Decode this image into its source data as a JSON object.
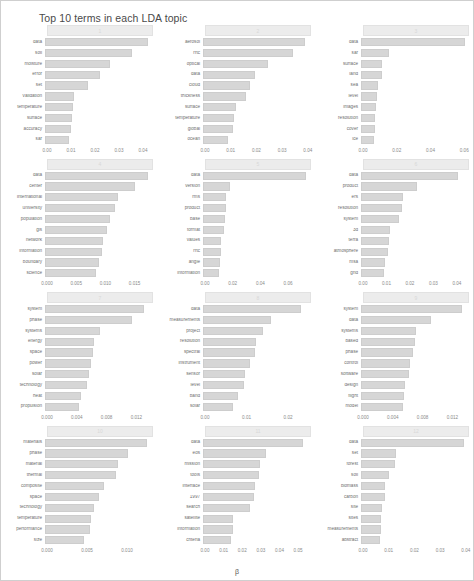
{
  "chart_data": {
    "type": "bar",
    "title": "Top 10 terms in each LDA topic",
    "xlabel": "β",
    "ylabel": "",
    "orientation": "horizontal",
    "grid": false,
    "legend": "none",
    "facets": [
      {
        "strip": "1",
        "xlim": [
          0,
          0.045
        ],
        "ticks": [
          "0.00",
          "0.01",
          "0.02",
          "0.03",
          "0.04"
        ],
        "tickvals": [
          0,
          0.01,
          0.02,
          0.03,
          0.04
        ],
        "categories": [
          "data",
          "soil",
          "moisture",
          "error",
          "set",
          "validation",
          "temperature",
          "surface",
          "accuracy",
          "sar"
        ],
        "values": [
          0.042,
          0.0355,
          0.0265,
          0.0225,
          0.0175,
          0.012,
          0.0115,
          0.0112,
          0.0108,
          0.01
        ]
      },
      {
        "strip": "2",
        "xlim": [
          0,
          0.042
        ],
        "ticks": [
          "0.00",
          "0.01",
          "0.02",
          "0.03",
          "0.04"
        ],
        "tickvals": [
          0,
          0.01,
          0.02,
          0.03,
          0.04
        ],
        "categories": [
          "aerosol",
          "rrtc",
          "optical",
          "data",
          "cloud",
          "thickness",
          "surface",
          "temperature",
          "global",
          "ocean"
        ],
        "values": [
          0.039,
          0.0345,
          0.025,
          0.02,
          0.018,
          0.0165,
          0.0125,
          0.012,
          0.0115,
          0.0095
        ]
      },
      {
        "strip": "3",
        "xlim": [
          0,
          0.064
        ],
        "ticks": [
          "0.00",
          "0.02",
          "0.04",
          "0.06"
        ],
        "tickvals": [
          0,
          0.02,
          0.04,
          0.06
        ],
        "categories": [
          "data",
          "sar",
          "surface",
          "land",
          "sea",
          "level",
          "images",
          "resolution",
          "cover",
          "ice"
        ],
        "values": [
          0.0605,
          0.0165,
          0.0125,
          0.012,
          0.0098,
          0.0095,
          0.0085,
          0.0082,
          0.008,
          0.0078
        ]
      },
      {
        "strip": "4",
        "xlim": [
          0,
          0.0185
        ],
        "ticks": [
          "0.000",
          "0.005",
          "0.010",
          "0.015"
        ],
        "tickvals": [
          0,
          0.005,
          0.01,
          0.015
        ],
        "categories": [
          "data",
          "center",
          "international",
          "university",
          "population",
          "gis",
          "network",
          "information",
          "boundary",
          "science"
        ],
        "values": [
          0.0173,
          0.0152,
          0.0122,
          0.0118,
          0.011,
          0.0105,
          0.0098,
          0.0096,
          0.009,
          0.0085
        ]
      },
      {
        "strip": "5",
        "xlim": [
          0,
          0.078
        ],
        "ticks": [
          "0.00",
          "0.02",
          "0.04",
          "0.06"
        ],
        "tickvals": [
          0,
          0.02,
          0.04,
          0.06
        ],
        "categories": [
          "data",
          "version",
          "rms",
          "product",
          "base",
          "format",
          "values",
          "rrtc",
          "angle",
          "information"
        ],
        "values": [
          0.073,
          0.019,
          0.0165,
          0.0162,
          0.0155,
          0.015,
          0.0128,
          0.0125,
          0.0122,
          0.011
        ]
      },
      {
        "strip": "6",
        "xlim": [
          0,
          0.046
        ],
        "ticks": [
          "0.00",
          "0.01",
          "0.02",
          "0.03",
          "0.04"
        ],
        "tickvals": [
          0,
          0.01,
          0.02,
          0.03,
          0.04
        ],
        "categories": [
          "data",
          "product",
          "ers",
          "resolution",
          "system",
          "3d",
          "terra",
          "atmosphere",
          "msa",
          "grid"
        ],
        "values": [
          0.0405,
          0.0235,
          0.0175,
          0.017,
          0.016,
          0.012,
          0.0115,
          0.0112,
          0.01,
          0.0098
        ]
      },
      {
        "strip": "7",
        "xlim": [
          0,
          0.0145
        ],
        "ticks": [
          "0.000",
          "0.004",
          "0.008",
          "0.012"
        ],
        "tickvals": [
          0,
          0.004,
          0.008,
          0.012
        ],
        "categories": [
          "system",
          "phase",
          "systems",
          "energy",
          "space",
          "power",
          "solar",
          "technology",
          "heat",
          "propulsion"
        ],
        "values": [
          0.013,
          0.0115,
          0.0072,
          0.0065,
          0.0063,
          0.006,
          0.0058,
          0.0055,
          0.0047,
          0.0045
        ]
      },
      {
        "strip": "8",
        "xlim": [
          0,
          0.026
        ],
        "ticks": [
          "0.00",
          "0.01",
          "0.02"
        ],
        "tickvals": [
          0,
          0.01,
          0.02
        ],
        "categories": [
          "data",
          "measurements",
          "project",
          "resolution",
          "spectral",
          "instrument",
          "sensor",
          "level",
          "band",
          "solar"
        ],
        "values": [
          0.0232,
          0.016,
          0.0142,
          0.0125,
          0.0122,
          0.011,
          0.01,
          0.0098,
          0.0082,
          0.0072
        ]
      },
      {
        "strip": "9",
        "xlim": [
          0,
          0.0145
        ],
        "ticks": [
          "0.000",
          "0.004",
          "0.008",
          "0.012"
        ],
        "tickvals": [
          0,
          0.004,
          0.008,
          0.012
        ],
        "categories": [
          "system",
          "data",
          "systems",
          "based",
          "phase",
          "control",
          "software",
          "design",
          "flight",
          "model"
        ],
        "values": [
          0.0133,
          0.0092,
          0.0073,
          0.0071,
          0.0068,
          0.0065,
          0.0063,
          0.0058,
          0.0057,
          0.0055
        ]
      },
      {
        "strip": "10",
        "xlim": [
          0,
          0.0135
        ],
        "ticks": [
          "0.000",
          "0.005",
          "0.010"
        ],
        "tickvals": [
          0,
          0.005,
          0.01
        ],
        "categories": [
          "materials",
          "phase",
          "material",
          "thermal",
          "composite",
          "space",
          "technology",
          "temperature",
          "performance",
          "size"
        ],
        "values": [
          0.0125,
          0.0102,
          0.009,
          0.0087,
          0.0072,
          0.0066,
          0.006,
          0.0057,
          0.0055,
          0.0048
        ]
      },
      {
        "strip": "11",
        "xlim": [
          0,
          0.058
        ],
        "ticks": [
          "0.00",
          "0.01",
          "0.02",
          "0.03",
          "0.04",
          "0.05"
        ],
        "tickvals": [
          0,
          0.01,
          0.02,
          0.03,
          0.04,
          0.05
        ],
        "categories": [
          "data",
          "eos",
          "mission",
          "tools",
          "interface",
          "1997",
          "search",
          "satellite",
          "information",
          "criteria"
        ],
        "values": [
          0.0525,
          0.033,
          0.03,
          0.0295,
          0.0275,
          0.027,
          0.0248,
          0.016,
          0.0158,
          0.0145
        ]
      },
      {
        "strip": "12",
        "xlim": [
          0,
          0.042
        ],
        "ticks": [
          "0.00",
          "0.01",
          "0.02",
          "0.03",
          "0.04"
        ],
        "tickvals": [
          0,
          0.01,
          0.02,
          0.03,
          0.04
        ],
        "categories": [
          "data",
          "set",
          "forest",
          "soil",
          "biomass",
          "carbon",
          "site",
          "sites",
          "measurements",
          "abstract"
        ],
        "values": [
          0.0395,
          0.0135,
          0.0128,
          0.0105,
          0.0092,
          0.009,
          0.008,
          0.0078,
          0.0075,
          0.0072
        ]
      }
    ]
  },
  "colors": {
    "bar": "#d6d6d6",
    "bar_border": "#cdcdcd",
    "strip": "#ececec",
    "text": "#6e6e6e",
    "background": "#ffffff"
  }
}
